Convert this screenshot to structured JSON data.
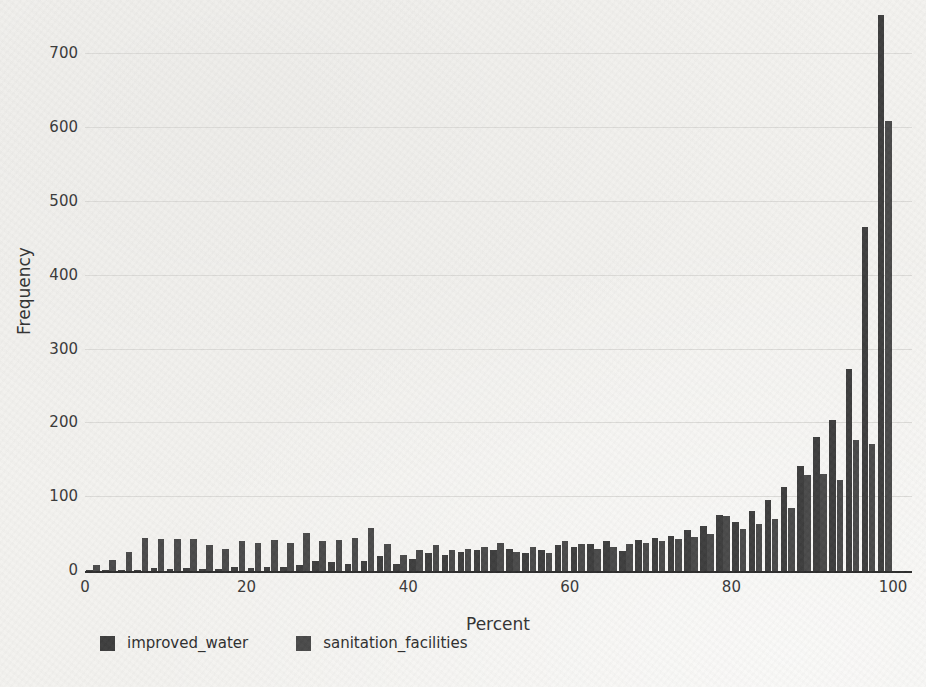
{
  "chart": {
    "y_ticks": [
      0,
      100,
      200,
      300,
      400,
      500,
      600,
      700
    ],
    "x_ticks": [
      0,
      20,
      40,
      60,
      80,
      100
    ],
    "colors": {
      "improved_water": "#3e3e3e",
      "sanitation_facilities": "#4a4a4a",
      "gridline": "#dcdbd8",
      "axis_line": "#2e2e2e",
      "text": "#333333",
      "background": "#f3f2ef"
    }
  },
  "chart_data": {
    "type": "bar",
    "subtype": "grouped-histogram",
    "title": "",
    "xlabel": "Percent",
    "ylabel": "Frequency",
    "xlim": [
      0,
      102
    ],
    "ylim": [
      0,
      760
    ],
    "grid": "horizontal",
    "legend_position": "bottom-left",
    "bin_width": 2,
    "bin_centers": [
      1,
      3,
      5,
      7,
      9,
      11,
      13,
      15,
      17,
      19,
      21,
      23,
      25,
      27,
      29,
      31,
      33,
      35,
      37,
      39,
      41,
      43,
      45,
      47,
      49,
      51,
      53,
      55,
      57,
      59,
      61,
      63,
      65,
      67,
      69,
      71,
      73,
      75,
      77,
      79,
      81,
      83,
      85,
      87,
      89,
      91,
      93,
      95,
      97,
      99
    ],
    "series": [
      {
        "name": "improved_water",
        "values": [
          2,
          1,
          1,
          2,
          4,
          3,
          4,
          3,
          3,
          5,
          4,
          6,
          5,
          8,
          14,
          12,
          10,
          14,
          20,
          10,
          16,
          25,
          22,
          26,
          28,
          28,
          30,
          24,
          28,
          35,
          33,
          36,
          40,
          27,
          42,
          45,
          48,
          55,
          61,
          76,
          67,
          81,
          96,
          114,
          142,
          182,
          204,
          273,
          466,
          753
        ]
      },
      {
        "name": "sanitation_facilities",
        "values": [
          8,
          15,
          26,
          45,
          43,
          43,
          44,
          35,
          30,
          40,
          38,
          42,
          38,
          52,
          40,
          42,
          45,
          58,
          36,
          22,
          28,
          35,
          28,
          30,
          32,
          38,
          26,
          32,
          24,
          40,
          36,
          30,
          33,
          36,
          38,
          40,
          43,
          46,
          50,
          74,
          57,
          64,
          70,
          85,
          130,
          131,
          123,
          177,
          172,
          610
        ]
      }
    ]
  }
}
